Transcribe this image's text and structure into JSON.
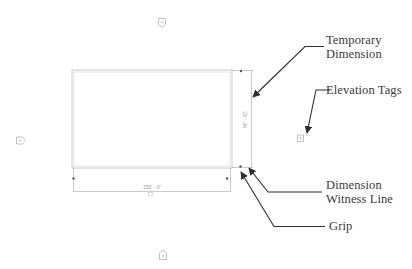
{
  "diagram": {
    "colors": {
      "wall": "#c8c8c8",
      "dimension": "#b4b4b4",
      "grip": "#555555",
      "arrow": "#2e2e2e",
      "label": "#3a3a3a"
    },
    "room": {
      "width_dimension": "150' - 0\"",
      "height_dimension": "90' - 0\""
    },
    "elevation_tags": [
      {
        "position": "top",
        "icon": "elevation-tag-icon"
      },
      {
        "position": "left",
        "icon": "elevation-tag-icon"
      },
      {
        "position": "right",
        "icon": "elevation-tag-icon"
      },
      {
        "position": "bottom",
        "icon": "elevation-tag-icon"
      }
    ],
    "callouts": {
      "temporary_dimension": {
        "line1": "Temporary",
        "line2": "Dimension"
      },
      "elevation_tags": {
        "line1": "Elevation Tags"
      },
      "dimension_witness_line": {
        "line1": "Dimension",
        "line2": "Witness Line"
      },
      "grip": {
        "line1": "Grip"
      }
    }
  }
}
